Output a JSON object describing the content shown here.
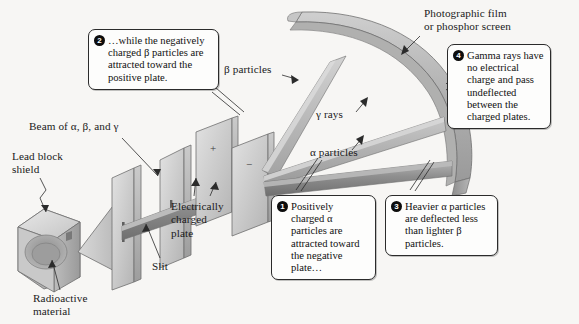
{
  "figure": {
    "background_color": "#f7f6f4",
    "ink_color": "#1a1a1a"
  },
  "labels": {
    "beam": "Beam of α, β, and γ",
    "lead_block_shield": "Lead block\nshield",
    "radioactive_material": "Radioactive\nmaterial",
    "slit": "Slit",
    "electrically_charged_plate": "Electrically\ncharged\nplate",
    "beta_particles": "β particles",
    "gamma_rays": "γ rays",
    "alpha_particles": "α particles",
    "photographic_film": "Photographic film\nor phosphor screen",
    "plate_positive_sign": "+",
    "plate_negative_sign": "−"
  },
  "callouts": [
    {
      "number": "1",
      "text": "Positively charged α particles are attracted toward the negative plate…"
    },
    {
      "number": "2",
      "text": "…while the negatively charged β particles are attracted toward the positive plate."
    },
    {
      "number": "3",
      "text": "Heavier α particles are deflected less than lighter β particles."
    },
    {
      "number": "4",
      "text": "Gamma rays have no electrical charge and pass undeflected between the charged plates."
    }
  ],
  "colors": {
    "metal_light": "#dcdcdc",
    "metal_mid": "#b9b9b9",
    "metal_dark": "#8f8f8f",
    "beam_light": "#cfcfcf",
    "beam_dark": "#8a8a8a",
    "outline": "#6e6e6e"
  }
}
